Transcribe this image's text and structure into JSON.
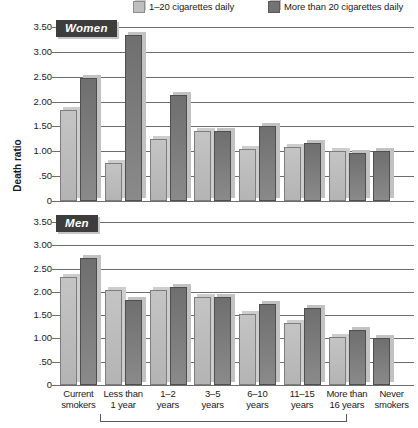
{
  "chart_data": {
    "type": "bar",
    "title": "",
    "xlabel": "",
    "ylabel": "Death ratio",
    "ylim": [
      0,
      3.5
    ],
    "yticks": [
      "0",
      ".50",
      "1.00",
      "1.50",
      "2.00",
      "2.50",
      "3.00",
      "3.50"
    ],
    "ytick_values": [
      0,
      0.5,
      1.0,
      1.5,
      2.0,
      2.5,
      3.0,
      3.5
    ],
    "grid": true,
    "legend_position": "top",
    "legend": [
      "1–20 cigarettes daily",
      "More than 20 cigarettes daily"
    ],
    "categories": [
      "Current smokers",
      "Less than 1 year",
      "1–2 years",
      "3–5 years",
      "6–10 years",
      "11–15 years",
      "More than 16 years",
      "Never smokers"
    ],
    "category_lines": [
      [
        "Current",
        "smokers"
      ],
      [
        "Less than",
        "1 year"
      ],
      [
        "1–2",
        "years"
      ],
      [
        "3–5",
        "years"
      ],
      [
        "6–10",
        "years"
      ],
      [
        "11–15",
        "years"
      ],
      [
        "More than",
        "16 years"
      ],
      [
        "Never",
        "smokers"
      ]
    ],
    "bracket_note": "Years since quitting (categories 2–7)",
    "panels": [
      {
        "name": "Women",
        "series": [
          {
            "name": "1–20 cigarettes daily",
            "values": [
              1.83,
              0.76,
              1.24,
              1.41,
              1.05,
              1.08,
              1.0,
              null
            ]
          },
          {
            "name": "More than 20 cigarettes daily",
            "values": [
              2.47,
              3.33,
              2.13,
              1.41,
              1.5,
              1.17,
              0.97,
              1.0
            ]
          }
        ]
      },
      {
        "name": "Men",
        "series": [
          {
            "name": "1–20 cigarettes daily",
            "values": [
              2.31,
              2.04,
              2.04,
              1.9,
              1.53,
              1.33,
              1.03,
              null
            ]
          },
          {
            "name": "More than 20 cigarettes daily",
            "values": [
              2.72,
              1.83,
              2.1,
              1.9,
              1.73,
              1.65,
              1.18,
              1.0
            ]
          }
        ]
      }
    ],
    "colors": {
      "light_bar": "#bcbcbc",
      "dark_bar": "#7a7a7a",
      "gridline": "#6e6e6e",
      "badge_background": "#3d3d3d",
      "badge_text": "#ffffff"
    }
  }
}
